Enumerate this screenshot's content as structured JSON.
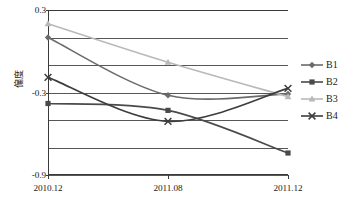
{
  "chart_data": {
    "type": "line",
    "title": "",
    "xlabel": "",
    "ylabel": "偏度",
    "categories": [
      "2010.12",
      "2011.08",
      "2011.12"
    ],
    "ylim": [
      -0.9,
      0.3
    ],
    "yticks": [
      0.3,
      -0.3,
      -0.9
    ],
    "ytick_labels": [
      "0.3",
      "-0.3",
      "-0.9"
    ],
    "gridlines": [
      0.3,
      0.1,
      -0.1,
      -0.3,
      -0.5,
      -0.7,
      -0.9
    ],
    "grid": true,
    "legend_position": "right",
    "series": [
      {
        "name": "B1",
        "values": [
          0.1,
          -0.32,
          -0.31
        ],
        "color": "#6b6b6b",
        "marker": "diamond"
      },
      {
        "name": "B2",
        "values": [
          -0.38,
          -0.43,
          -0.74
        ],
        "color": "#4a4a4a",
        "marker": "square"
      },
      {
        "name": "B3",
        "values": [
          0.2,
          -0.08,
          -0.33
        ],
        "color": "#b9b9b9",
        "marker": "triangle"
      },
      {
        "name": "B4",
        "values": [
          -0.19,
          -0.51,
          -0.27
        ],
        "color": "#3d3d3d",
        "marker": "cross"
      }
    ]
  },
  "legend": {
    "items": [
      {
        "label": "B1"
      },
      {
        "label": "B2"
      },
      {
        "label": "B3"
      },
      {
        "label": "B4"
      }
    ]
  },
  "axes": {
    "y_axis_title": "偏度",
    "y_tick_labels": [
      "0.3",
      "-0.3",
      "-0.9"
    ],
    "x_tick_labels": [
      "2010.12",
      "2011.08",
      "2011.12"
    ]
  }
}
